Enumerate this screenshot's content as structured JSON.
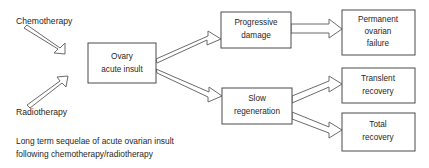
{
  "figure": {
    "caption_line_1": "Long term sequelae of acute ovarian insult",
    "caption_line_2": "following chemotherapy/radiotherapy"
  },
  "sources": [
    {
      "id": "chemotherapy",
      "label": "Chemotherapy"
    },
    {
      "id": "radiotherapy",
      "label": "Radiotherapy"
    }
  ],
  "nodes": {
    "central": {
      "line_1": "Ovary",
      "line_2": "acute insult"
    },
    "progressive_damage": {
      "line_1": "Progressive",
      "line_2": "damage"
    },
    "slow_regeneration": {
      "line_1": "Slow",
      "line_2": "regeneration"
    },
    "permanent_ovarian_failure": {
      "line_1": "Permanent",
      "line_2": "ovarian",
      "line_3": "failure"
    },
    "transient_recovery": {
      "line_1": "Translent",
      "line_2": "recovery"
    },
    "total_recovery": {
      "line_1": "Total",
      "line_2": "recovery"
    }
  },
  "colors": {
    "background": "#ffffff",
    "box_border": "#4a4a4a",
    "arrow_outline": "#6b6b6b",
    "text": "#1f1f1f"
  }
}
